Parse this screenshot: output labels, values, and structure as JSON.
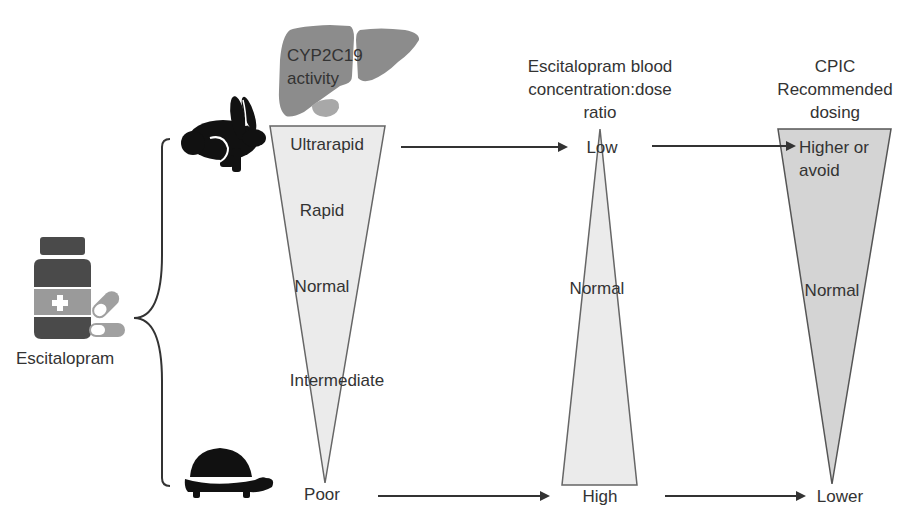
{
  "diagram": {
    "drug": {
      "label": "Escitalopram",
      "icon": "medicine-bottle-icon"
    },
    "speed_icons": {
      "fast": "rabbit-icon",
      "slow": "turtle-icon"
    },
    "columns": [
      {
        "id": "cyp2c19",
        "header_lines": [
          "CYP2C19",
          "activity"
        ],
        "icon": "liver-icon",
        "shape": "inverted-triangle",
        "fill": "#ebebeb",
        "levels": [
          "Ultrarapid",
          "Rapid",
          "Normal",
          "Intermediate",
          "Poor"
        ]
      },
      {
        "id": "blood-ratio",
        "header_lines": [
          "Escitalopram blood",
          "concentration:dose",
          "ratio"
        ],
        "shape": "upright-triangle",
        "fill": "#ebebeb",
        "levels": [
          "Low",
          "Normal",
          "High"
        ]
      },
      {
        "id": "cpic-dosing",
        "header_lines": [
          "CPIC",
          "Recommended",
          "dosing"
        ],
        "shape": "inverted-triangle",
        "fill": "#d4d4d4",
        "levels": [
          "Higher or",
          "avoid",
          "Normal",
          "Lower"
        ]
      }
    ],
    "arrows": [
      {
        "from": "Ultrarapid",
        "to": "Low"
      },
      {
        "from": "Low",
        "to": "Higher or avoid"
      },
      {
        "from": "Poor",
        "to": "High"
      },
      {
        "from": "High",
        "to": "Lower"
      }
    ],
    "colors": {
      "text": "#333333",
      "outline": "#555555",
      "liver": "#8c8c8c",
      "liver_light": "#a8a8a8",
      "icon_dark": "#111111",
      "bottle": "#4a4a4a",
      "bottle_label": "#9a9a9a",
      "pill": "#a0a0a0"
    }
  }
}
